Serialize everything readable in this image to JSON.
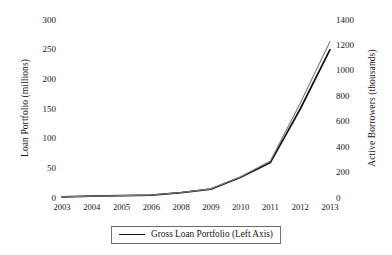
{
  "chart_data": {
    "type": "line",
    "title": "",
    "subtitle": "",
    "xlabel": "",
    "ylabel": "Loan Portfolio (millions)",
    "y2label": "Active Borrowers (thousands)",
    "categories": [
      "2003",
      "2004",
      "2005",
      "2006",
      "2008",
      "2009",
      "2010",
      "2011",
      "2012",
      "2013"
    ],
    "grid": false,
    "legend_position": "bottom-center",
    "ylim": [
      0,
      300
    ],
    "yticks": [
      0,
      50,
      100,
      150,
      200,
      250,
      300
    ],
    "ytick_labels": [
      "0",
      "50",
      "100",
      "150",
      "200",
      "250",
      "300"
    ],
    "y2lim": [
      0,
      1400
    ],
    "y2ticks": [
      0,
      200,
      400,
      600,
      800,
      1000,
      1200,
      1400
    ],
    "y2tick_labels": [
      "0",
      "200",
      "400",
      "600",
      "800",
      "1000",
      "1200",
      "1400"
    ],
    "series": [
      {
        "name": "Gross Loan Portfolio (Left Axis)",
        "axis": "left",
        "color": "#111111",
        "values": [
          2,
          3,
          4,
          5,
          9,
          15,
          35,
          60,
          150,
          250
        ]
      },
      {
        "name": "Active Borrowers (Right Axis)",
        "axis": "right",
        "color": "#7d7d7d",
        "values": [
          10,
          14,
          19,
          24,
          43,
          72,
          168,
          292,
          745,
          1230
        ]
      }
    ],
    "annotations": []
  },
  "legend": {
    "entries": [
      {
        "label": "Gross Loan Portfolio (Left Axis)",
        "color": "#111111"
      }
    ]
  }
}
